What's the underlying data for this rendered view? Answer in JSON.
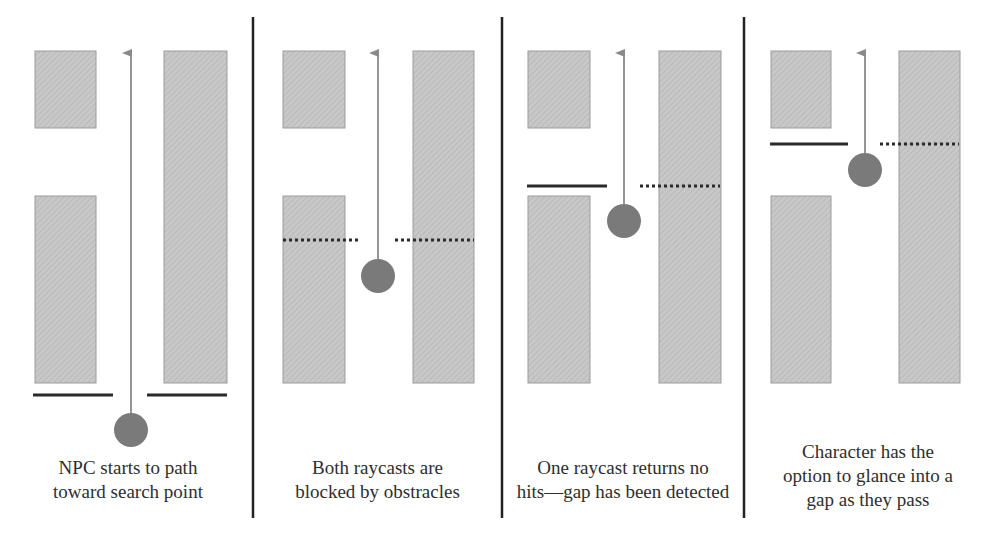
{
  "figure": {
    "colors": {
      "obstacle_fill": "#c6c6c6",
      "obstacle_border": "#9c9c9c",
      "npc": "#7a7a7a",
      "arrow": "#8a8a8a",
      "raycast_hit": "#2a2a2a",
      "raycast_miss": "#2a2a2a",
      "separator": "#222222",
      "text": "#2e2e2e"
    },
    "panels": [
      {
        "id": "panel-1",
        "caption_lines": [
          "NPC starts to path",
          "toward search point"
        ],
        "npc": {
          "cx": 131,
          "cy": 430
        },
        "arrow": {
          "x": 131,
          "y_top": 52,
          "y_bottom": 413
        },
        "rays": [
          {
            "side": "left",
            "type": "solid",
            "x1": 33,
            "x2": 113,
            "y": 395
          },
          {
            "side": "right",
            "type": "solid",
            "x1": 147,
            "x2": 227,
            "y": 395
          }
        ],
        "blocks": [
          {
            "x": 35,
            "y": 51,
            "w": 61,
            "h": 77
          },
          {
            "x": 35,
            "y": 196,
            "w": 61,
            "h": 187
          },
          {
            "x": 164,
            "y": 51,
            "w": 63,
            "h": 332
          }
        ]
      },
      {
        "id": "panel-2",
        "caption_lines": [
          "Both raycasts are",
          "blocked by obstracles"
        ],
        "npc": {
          "cx": 378,
          "cy": 276
        },
        "arrow": {
          "x": 378,
          "y_top": 52,
          "y_bottom": 259
        },
        "rays": [
          {
            "side": "left",
            "type": "dotted",
            "x1": 283,
            "x2": 361,
            "y": 240
          },
          {
            "side": "right",
            "type": "dotted",
            "x1": 395,
            "x2": 474,
            "y": 240
          }
        ],
        "blocks": [
          {
            "x": 283,
            "y": 51,
            "w": 62,
            "h": 77
          },
          {
            "x": 283,
            "y": 196,
            "w": 62,
            "h": 187
          },
          {
            "x": 413,
            "y": 51,
            "w": 61,
            "h": 332
          }
        ]
      },
      {
        "id": "panel-3",
        "caption_lines": [
          "One raycast returns no",
          "hits—gap has been detected"
        ],
        "npc": {
          "cx": 624,
          "cy": 221
        },
        "arrow": {
          "x": 624,
          "y_top": 52,
          "y_bottom": 204
        },
        "rays": [
          {
            "side": "left",
            "type": "solid",
            "x1": 527,
            "x2": 607,
            "y": 186
          },
          {
            "side": "right",
            "type": "dotted",
            "x1": 640,
            "x2": 720,
            "y": 186
          }
        ],
        "blocks": [
          {
            "x": 528,
            "y": 51,
            "w": 62,
            "h": 77
          },
          {
            "x": 528,
            "y": 196,
            "w": 62,
            "h": 187
          },
          {
            "x": 659,
            "y": 51,
            "w": 62,
            "h": 332
          }
        ]
      },
      {
        "id": "panel-4",
        "caption_lines": [
          "Character has the",
          "option to glance into a",
          "gap as they pass"
        ],
        "npc": {
          "cx": 865,
          "cy": 170
        },
        "arrow": {
          "x": 865,
          "y_top": 52,
          "y_bottom": 153
        },
        "rays": [
          {
            "side": "left",
            "type": "solid",
            "x1": 770,
            "x2": 848,
            "y": 144
          },
          {
            "side": "right",
            "type": "dotted",
            "x1": 880,
            "x2": 959,
            "y": 144
          }
        ],
        "blocks": [
          {
            "x": 771,
            "y": 51,
            "w": 60,
            "h": 77
          },
          {
            "x": 771,
            "y": 196,
            "w": 60,
            "h": 187
          },
          {
            "x": 899,
            "y": 51,
            "w": 61,
            "h": 332
          }
        ]
      }
    ],
    "separators": [
      253,
      502,
      744
    ]
  }
}
